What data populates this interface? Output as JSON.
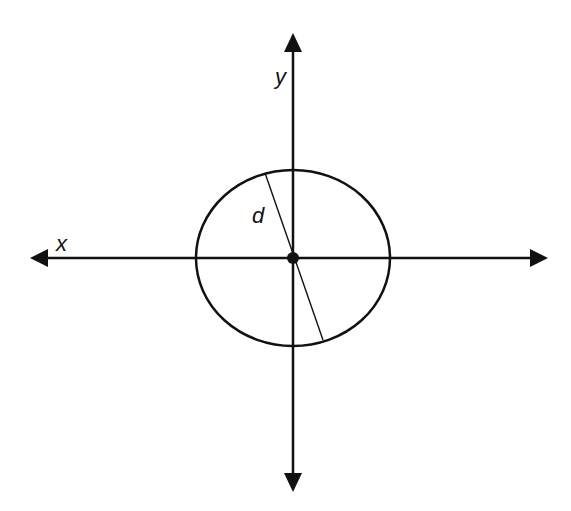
{
  "diagram": {
    "title": "",
    "colors": {
      "stroke": "#111111",
      "background": "#ffffff"
    },
    "axes": {
      "x": {
        "label": "x",
        "from": [
          548,
          258
        ],
        "to": [
          30,
          258
        ],
        "arrows": "both"
      },
      "y": {
        "label": "y",
        "from": [
          293,
          492
        ],
        "to": [
          293,
          33
        ],
        "arrows": "both"
      }
    },
    "origin": {
      "cx": 293,
      "cy": 258,
      "r": 6
    },
    "ellipse": {
      "cx": 293,
      "cy": 258,
      "rx": 97,
      "ry": 88
    },
    "diameter_line": {
      "label": "d",
      "x1": 265,
      "y1": 173,
      "x2": 323,
      "y2": 340
    },
    "labels": {
      "x": "x",
      "y": "y",
      "d": "d"
    }
  }
}
